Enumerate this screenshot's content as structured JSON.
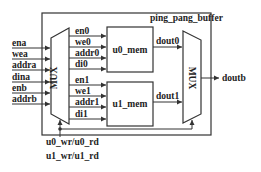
{
  "diagram": {
    "title": "ping_pang_buffer",
    "colors": {
      "line": "#333333",
      "text": "#222222",
      "background": "#ffffff"
    },
    "inputs": [
      {
        "label": "ena"
      },
      {
        "label": "wea"
      },
      {
        "label": "addra"
      },
      {
        "label": "dina"
      },
      {
        "label": "enb"
      },
      {
        "label": "addrb"
      }
    ],
    "left_mux": {
      "label": "MUX"
    },
    "right_mux": {
      "label": "MUX"
    },
    "mem0": {
      "label": "u0_mem",
      "signals": [
        "en0",
        "we0",
        "addr0",
        "di0"
      ],
      "output": "dout0"
    },
    "mem1": {
      "label": "u1_mem",
      "signals": [
        "en1",
        "we1",
        "addr1",
        "di1"
      ],
      "output": "dout1"
    },
    "output": {
      "label": "doutb"
    },
    "select_labels": [
      "u0_wr/u0_rd",
      "u1_wr/u1_rd"
    ]
  }
}
